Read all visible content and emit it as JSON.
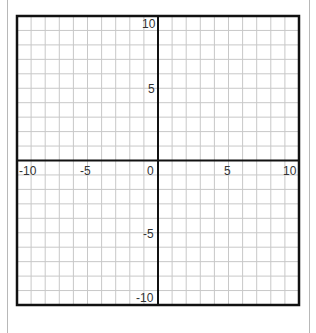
{
  "chart_data": {
    "type": "coordinate-grid",
    "title": "",
    "x_range": [
      -10,
      10
    ],
    "y_range": [
      -10,
      10
    ],
    "grid_step": 1,
    "grid": true,
    "x_tick_labels": [
      "-10",
      "-5",
      "0",
      "5",
      "10"
    ],
    "y_tick_labels": [
      "10",
      "5",
      "-5",
      "-10"
    ],
    "series": []
  },
  "labels": {
    "x_neg10": "-10",
    "x_neg5": "-5",
    "origin": "0",
    "x_5": "5",
    "x_10": "10",
    "y_10": "10",
    "y_5": "5",
    "y_neg5": "-5",
    "y_neg10": "-10"
  },
  "colors": {
    "grid": "#c8c8c8",
    "axis": "#111111",
    "border": "#111111"
  }
}
